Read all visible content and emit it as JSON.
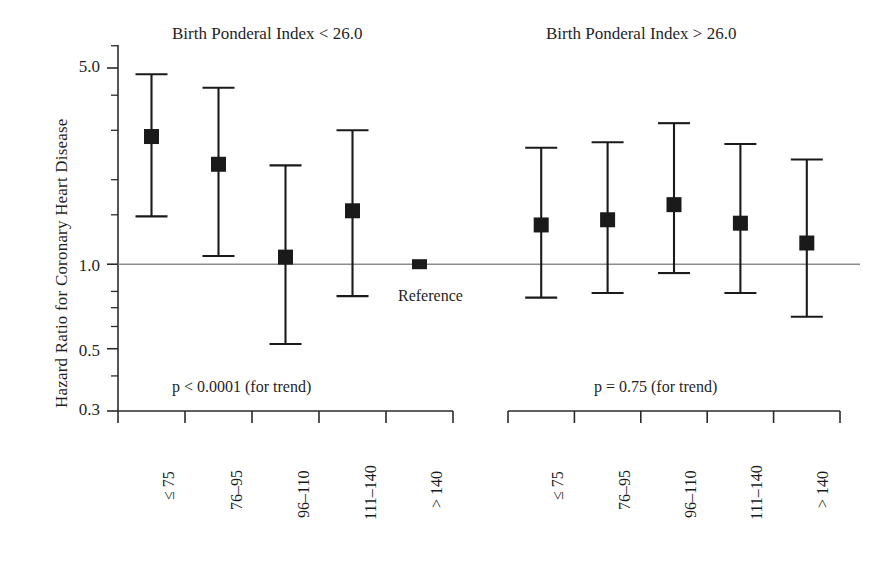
{
  "chart_data": {
    "type": "scatter",
    "title": "",
    "xlabel": "Household Income (1000 Marks per year)",
    "ylabel": "Hazard Ratio for Coronary Heart Disease",
    "yscale": "log",
    "ylim": [
      0.3,
      6.3
    ],
    "ytick_values": [
      5.0,
      1.0,
      0.5,
      0.3
    ],
    "ytick_labels": [
      "5.0",
      "1.0",
      "0.5",
      "0.3"
    ],
    "reference_line": 1.0,
    "reference_note": "Reference",
    "grid": false,
    "legend": "none",
    "categories": [
      "≤ 75",
      "76–95",
      "96–110",
      "111–140",
      "> 140"
    ],
    "panels": [
      {
        "title": "Birth Ponderal Index < 26.0",
        "pvalue": "p < 0.0001 (for trend)",
        "points": [
          {
            "category": "≤ 75",
            "hazard_ratio": 2.85,
            "ci_low": 1.48,
            "ci_high": 4.75
          },
          {
            "category": "76–95",
            "hazard_ratio": 2.27,
            "ci_low": 1.07,
            "ci_high": 4.25
          },
          {
            "category": "96–110",
            "hazard_ratio": 1.06,
            "ci_low": 0.52,
            "ci_high": 2.25
          },
          {
            "category": "111–140",
            "hazard_ratio": 1.55,
            "ci_low": 0.77,
            "ci_high": 3.0
          },
          {
            "category": "> 140",
            "hazard_ratio": 1.0,
            "ci_low": 1.0,
            "ci_high": 1.0,
            "is_reference": true
          }
        ]
      },
      {
        "title": "Birth Ponderal Index > 26.0",
        "pvalue": "p = 0.75 (for trend)",
        "points": [
          {
            "category": "≤ 75",
            "hazard_ratio": 1.38,
            "ci_low": 0.76,
            "ci_high": 2.6
          },
          {
            "category": "76–95",
            "hazard_ratio": 1.44,
            "ci_low": 0.79,
            "ci_high": 2.72
          },
          {
            "category": "96–110",
            "hazard_ratio": 1.63,
            "ci_low": 0.93,
            "ci_high": 3.18
          },
          {
            "category": "111–140",
            "hazard_ratio": 1.4,
            "ci_low": 0.79,
            "ci_high": 2.68
          },
          {
            "category": "> 140",
            "hazard_ratio": 1.19,
            "ci_low": 0.65,
            "ci_high": 2.36
          }
        ]
      }
    ]
  },
  "axis": {
    "ylabel": "Hazard Ratio for Coronary Heart Disease",
    "xlabel": "Household Income (1000 Marks per year)",
    "yticks": [
      {
        "label": "5.0"
      },
      {
        "label": "1.0"
      },
      {
        "label": "0.5"
      },
      {
        "label": "0.3"
      }
    ]
  },
  "panel_left": {
    "title": "Birth Ponderal Index < 26.0",
    "pvalue": "p < 0.0001 (for trend)",
    "reference_note": "Reference",
    "xticks": [
      "≤ 75",
      "76–95",
      "96–110",
      "111–140",
      "> 140"
    ]
  },
  "panel_right": {
    "title": "Birth Ponderal Index > 26.0",
    "pvalue": "p = 0.75 (for trend)",
    "xticks": [
      "≤ 75",
      "76–95",
      "96–110",
      "111–140",
      "> 140"
    ]
  },
  "colors": {
    "marker": "#1a1a1a",
    "axis": "#2b2b2b",
    "reference_line": "#8c8c8c",
    "background": "#ffffff"
  }
}
